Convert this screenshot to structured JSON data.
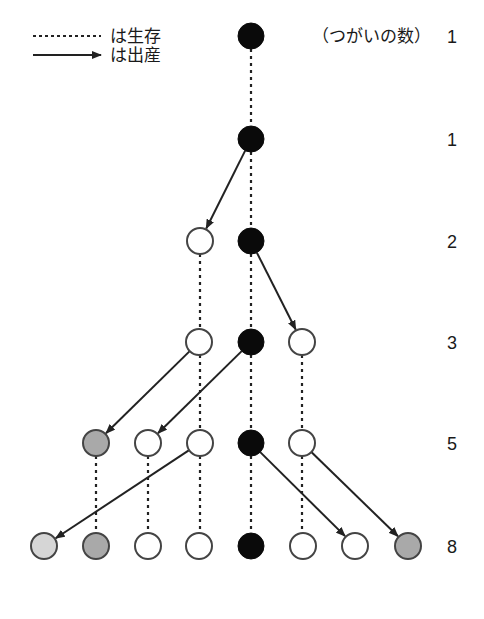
{
  "legend": {
    "survival_label": "は生存",
    "birth_label": "は出産"
  },
  "header_label": "（つがいの数）",
  "colors": {
    "black": "#0a0a0a",
    "white": "#ffffff",
    "light_gray": "#d6d6d6",
    "medium_gray": "#a9a9a9",
    "stroke": "#444444",
    "line": "#222222"
  },
  "rows": [
    {
      "y": 36,
      "count": "1",
      "nodes": [
        {
          "x": 251,
          "fill": "black"
        }
      ]
    },
    {
      "y": 139,
      "count": "1",
      "nodes": [
        {
          "x": 251,
          "fill": "black"
        }
      ]
    },
    {
      "y": 241,
      "count": "2",
      "nodes": [
        {
          "x": 200,
          "fill": "white"
        },
        {
          "x": 251,
          "fill": "black"
        }
      ]
    },
    {
      "y": 342,
      "count": "3",
      "nodes": [
        {
          "x": 199,
          "fill": "white"
        },
        {
          "x": 251,
          "fill": "black"
        },
        {
          "x": 302,
          "fill": "white"
        }
      ]
    },
    {
      "y": 443,
      "count": "5",
      "nodes": [
        {
          "x": 96,
          "fill": "medium_gray"
        },
        {
          "x": 148,
          "fill": "white"
        },
        {
          "x": 200,
          "fill": "white"
        },
        {
          "x": 251,
          "fill": "black"
        },
        {
          "x": 302,
          "fill": "white"
        }
      ]
    },
    {
      "y": 546,
      "count": "8",
      "nodes": [
        {
          "x": 44,
          "fill": "light_gray"
        },
        {
          "x": 96,
          "fill": "medium_gray"
        },
        {
          "x": 148,
          "fill": "white"
        },
        {
          "x": 199,
          "fill": "white"
        },
        {
          "x": 251,
          "fill": "black"
        },
        {
          "x": 303,
          "fill": "white"
        },
        {
          "x": 355,
          "fill": "white"
        },
        {
          "x": 408,
          "fill": "medium_gray"
        }
      ]
    }
  ],
  "survival_links": [
    {
      "x": 251,
      "y1": 36,
      "y2": 139
    },
    {
      "x": 251,
      "y1": 139,
      "y2": 241
    },
    {
      "x": 200,
      "y1": 241,
      "y2": 342
    },
    {
      "x": 251,
      "y1": 241,
      "y2": 342
    },
    {
      "x": 200,
      "y1": 342,
      "y2": 443
    },
    {
      "x": 251,
      "y1": 342,
      "y2": 443
    },
    {
      "x": 302,
      "y1": 342,
      "y2": 443
    },
    {
      "x": 96,
      "y1": 443,
      "y2": 546
    },
    {
      "x": 148,
      "y1": 443,
      "y2": 546
    },
    {
      "x": 200,
      "y1": 443,
      "y2": 546
    },
    {
      "x": 251,
      "y1": 443,
      "y2": 546
    },
    {
      "x": 302,
      "y1": 443,
      "y2": 546
    }
  ],
  "birth_links": [
    {
      "from": [
        251,
        139
      ],
      "to": [
        200,
        241
      ]
    },
    {
      "from": [
        251,
        241
      ],
      "to": [
        302,
        342
      ]
    },
    {
      "from": [
        199,
        342
      ],
      "to": [
        96,
        443
      ]
    },
    {
      "from": [
        251,
        342
      ],
      "to": [
        148,
        443
      ]
    },
    {
      "from": [
        200,
        443
      ],
      "to": [
        44,
        546
      ]
    },
    {
      "from": [
        251,
        443
      ],
      "to": [
        355,
        546
      ]
    },
    {
      "from": [
        302,
        443
      ],
      "to": [
        408,
        546
      ]
    }
  ],
  "layout": {
    "radius": 13,
    "count_x": 447
  }
}
